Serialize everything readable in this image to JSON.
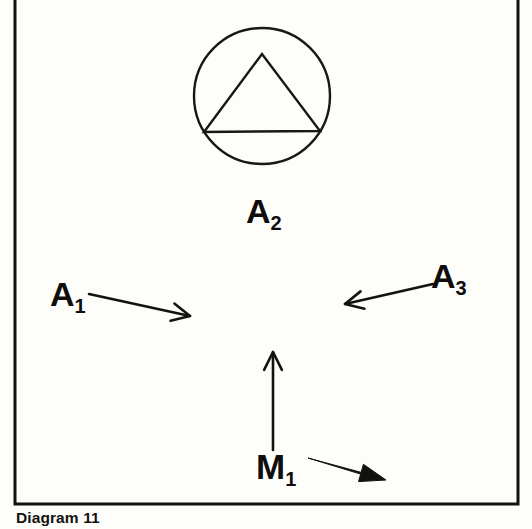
{
  "figure": {
    "caption": "Diagram 11",
    "background_color": "#fdfdfa",
    "ink_color": "#14120f",
    "frame": {
      "name": "diagram-border-box",
      "x": 15,
      "y": 0,
      "width": 503,
      "height": 504,
      "stroke_width": 3
    },
    "symbol": {
      "name": "circle-triangle-symbol",
      "circle": {
        "cx": 262,
        "cy": 96,
        "r": 68,
        "stroke_width": 2.4
      },
      "triangle": {
        "apex_x": 262,
        "apex_y": 54,
        "left_x": 204,
        "left_y": 132,
        "right_x": 320,
        "right_y": 131,
        "stroke_width": 2.4
      }
    },
    "labels": [
      {
        "id": "a2",
        "base": "A",
        "sub": "2",
        "x": 246,
        "y": 194
      },
      {
        "id": "a1",
        "base": "A",
        "sub": "1",
        "x": 50,
        "y": 277
      },
      {
        "id": "a3",
        "base": "A",
        "sub": "3",
        "x": 431,
        "y": 259
      },
      {
        "id": "m1",
        "base": "M",
        "sub": "1",
        "x": 256,
        "y": 449
      }
    ],
    "arrows": [
      {
        "id": "a1-arrow",
        "name": "arrow-right-a1",
        "style": "open-vee",
        "from": [
          89,
          294
        ],
        "to": [
          190,
          316
        ],
        "head_angle_deg": 12,
        "stroke_width": 2.6,
        "direction": "right"
      },
      {
        "id": "a3-arrow",
        "name": "arrow-left-a3",
        "style": "open-vee",
        "from": [
          433,
          284
        ],
        "to": [
          345,
          304
        ],
        "head_angle_deg": 193,
        "stroke_width": 2.6,
        "direction": "left"
      },
      {
        "id": "m1-arrow",
        "name": "arrow-up-m1",
        "style": "open-vee",
        "from": [
          273,
          450
        ],
        "to": [
          273,
          352
        ],
        "head_angle_deg": 270,
        "stroke_width": 2.6,
        "direction": "up"
      },
      {
        "id": "m1-dart",
        "name": "arrow-filled-dart-m1",
        "style": "filled-dart",
        "from": [
          308,
          458
        ],
        "to": [
          386,
          480
        ],
        "stroke_width": 2.2,
        "direction": "down-right"
      }
    ]
  }
}
